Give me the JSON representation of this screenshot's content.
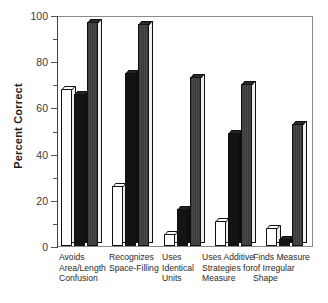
{
  "chart_data": {
    "type": "bar",
    "title": "",
    "xlabel": "",
    "ylabel": "Percent Correct",
    "ylim": [
      0,
      100
    ],
    "yticks": [
      0,
      20,
      40,
      60,
      80,
      100
    ],
    "ytick_labels": [
      "0",
      "20",
      "40",
      "60",
      "80",
      "100"
    ],
    "minor_yticks": [
      10,
      30,
      50,
      70,
      90
    ],
    "grid": false,
    "legend": false,
    "legend_position": "none",
    "style": "3d-isometric-grouped-bar",
    "categories": [
      "Avoids Area/Length Confusion",
      "Recognizes Space-Filling",
      "Uses Identical Units",
      "Uses Additive Strategies for Measure",
      "Finds Measure of Irregular Shape"
    ],
    "category_lines": [
      [
        "Avoids",
        "Area/Length",
        "Confusion"
      ],
      [
        "Recognizes",
        "Space-Filling"
      ],
      [
        "Uses",
        "Identical",
        "Units"
      ],
      [
        "Uses Additive",
        "Strategies for",
        "Measure"
      ],
      [
        "Finds Measure",
        "of Irregular",
        "Shape"
      ]
    ],
    "series": [
      {
        "name": "white",
        "color": "#ffffff",
        "values": [
          68,
          26,
          5,
          11,
          8
        ]
      },
      {
        "name": "black",
        "color": "#131313",
        "values": [
          66,
          75,
          16,
          49,
          3
        ]
      },
      {
        "name": "dark-gray",
        "color": "#3b3b3b",
        "values": [
          97,
          96,
          73,
          70,
          53
        ]
      }
    ]
  },
  "axis": {
    "ylabel": "Percent Correct"
  }
}
